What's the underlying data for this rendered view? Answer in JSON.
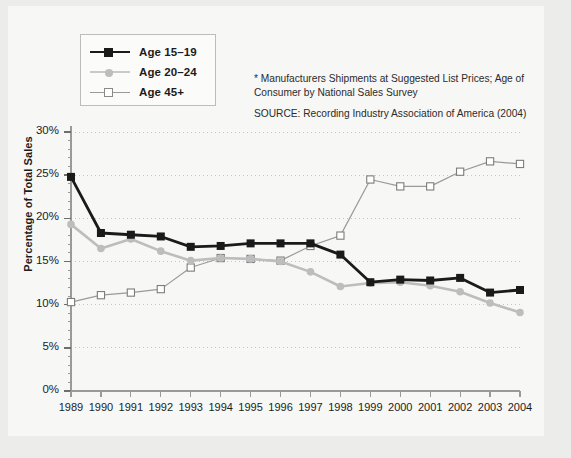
{
  "chart_data": {
    "type": "line",
    "title": "",
    "xlabel": "",
    "ylabel": "Percentage of Total Sales",
    "categories": [
      "1989",
      "1990",
      "1991",
      "1992",
      "1993",
      "1994",
      "1995",
      "1996",
      "1997",
      "1998",
      "1999",
      "2000",
      "2001",
      "2002",
      "2003",
      "2004"
    ],
    "ylim": [
      0,
      30
    ],
    "ytick_labels": [
      "0%",
      "5%",
      "10%",
      "15%",
      "20%",
      "25%",
      "30%"
    ],
    "ytick_values": [
      0,
      5,
      10,
      15,
      20,
      25,
      30
    ],
    "grid": true,
    "legend_position": "top-left",
    "series": [
      {
        "name": "Age 15–19",
        "color": "#1a1a1a",
        "marker": "filled-square",
        "values": [
          24.8,
          18.3,
          18.1,
          17.9,
          16.7,
          16.8,
          17.1,
          17.1,
          17.1,
          15.8,
          12.6,
          12.9,
          12.8,
          13.1,
          11.4,
          11.7
        ]
      },
      {
        "name": "Age 20–24",
        "color": "#bdbdbd",
        "marker": "filled-circle",
        "values": [
          19.3,
          16.5,
          17.6,
          16.2,
          15.1,
          15.4,
          15.3,
          15.0,
          13.8,
          12.1,
          12.5,
          12.6,
          12.2,
          11.5,
          10.2,
          9.1
        ]
      },
      {
        "name": "Age 45+",
        "color": "#9a9a9a",
        "marker": "open-square",
        "values": [
          10.3,
          11.1,
          11.4,
          11.8,
          14.3,
          15.4,
          15.3,
          15.1,
          16.8,
          18.0,
          24.5,
          23.7,
          23.7,
          25.4,
          26.6,
          26.3
        ]
      }
    ]
  },
  "legend": {
    "items": [
      {
        "label": "Age 15–19"
      },
      {
        "label": "Age 20–24"
      },
      {
        "label": "Age 45+"
      }
    ]
  },
  "note": {
    "footnote": "* Manufacturers Shipments at Suggested List Prices; Age of Consumer by National Sales Survey",
    "source": "SOURCE: Recording Industry Association of America  (2004)"
  }
}
